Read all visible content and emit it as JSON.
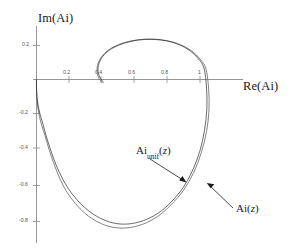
{
  "figure": {
    "background_color": "#ffffff",
    "axis_color": "#8a8a8a",
    "curve_ai_color": "#6d6d6d",
    "curve_unif_color": "#2b2b2b"
  },
  "axes": {
    "x_title": "Re(Ai)",
    "y_title": "Im(Ai)",
    "x_ticks": [
      "0.2",
      "0.4",
      "0.6",
      "0.8",
      "1"
    ],
    "y_ticks": [
      "0.2",
      "-0.2",
      "-0.4",
      "-0.6",
      "-0.8"
    ]
  },
  "annotations": {
    "unif": {
      "base": "Ai",
      "sub": "unif",
      "arg": "(",
      "var": "z",
      "close": ")"
    },
    "exact": {
      "base": "Ai",
      "arg": "(",
      "var": "z",
      "close": ")"
    }
  },
  "chart_data": {
    "type": "line",
    "title": "",
    "xlabel": "Re(Ai)",
    "ylabel": "Im(Ai)",
    "xlim": [
      -0.05,
      1.12
    ],
    "ylim": [
      -0.92,
      0.28
    ],
    "grid": false,
    "legend": "annotated-arrows",
    "xticks": [
      0.2,
      0.4,
      0.6,
      0.8,
      1.0
    ],
    "yticks": [
      0.2,
      -0.2,
      -0.4,
      -0.6,
      -0.8
    ],
    "series": [
      {
        "name": "Ai(z)",
        "color": "#6d6d6d",
        "points": [
          [
            0.0,
            0.0
          ],
          [
            0.0,
            -0.055
          ],
          [
            0.002,
            -0.11
          ],
          [
            0.008,
            -0.165
          ],
          [
            0.018,
            -0.218
          ],
          [
            0.032,
            -0.27
          ],
          [
            0.052,
            -0.33
          ],
          [
            0.07,
            -0.39
          ],
          [
            0.09,
            -0.45
          ],
          [
            0.116,
            -0.52
          ],
          [
            0.146,
            -0.59
          ],
          [
            0.186,
            -0.662
          ],
          [
            0.238,
            -0.73
          ],
          [
            0.3,
            -0.79
          ],
          [
            0.375,
            -0.838
          ],
          [
            0.46,
            -0.868
          ],
          [
            0.552,
            -0.873
          ],
          [
            0.648,
            -0.852
          ],
          [
            0.74,
            -0.806
          ],
          [
            0.822,
            -0.738
          ],
          [
            0.9,
            -0.65
          ],
          [
            0.962,
            -0.546
          ],
          [
            1.008,
            -0.43
          ],
          [
            1.04,
            -0.306
          ],
          [
            1.055,
            -0.18
          ],
          [
            1.053,
            -0.056
          ],
          [
            1.036,
            0.064
          ],
          [
            1.002,
            0.118
          ],
          [
            0.95,
            0.168
          ],
          [
            0.88,
            0.205
          ],
          [
            0.8,
            0.228
          ],
          [
            0.712,
            0.238
          ],
          [
            0.624,
            0.234
          ],
          [
            0.54,
            0.218
          ],
          [
            0.468,
            0.19
          ],
          [
            0.414,
            0.152
          ],
          [
            0.382,
            0.108
          ],
          [
            0.37,
            0.06
          ],
          [
            0.378,
            0.016
          ],
          [
            0.402,
            -0.02
          ]
        ]
      },
      {
        "name": "Ai_unif(z)",
        "color": "#2b2b2b",
        "points": [
          [
            0.0,
            0.0
          ],
          [
            0.0,
            -0.05
          ],
          [
            0.003,
            -0.1
          ],
          [
            0.01,
            -0.152
          ],
          [
            0.022,
            -0.205
          ],
          [
            0.038,
            -0.258
          ],
          [
            0.054,
            -0.315
          ],
          [
            0.072,
            -0.372
          ],
          [
            0.092,
            -0.43
          ],
          [
            0.118,
            -0.498
          ],
          [
            0.15,
            -0.566
          ],
          [
            0.192,
            -0.638
          ],
          [
            0.246,
            -0.706
          ],
          [
            0.31,
            -0.766
          ],
          [
            0.386,
            -0.814
          ],
          [
            0.47,
            -0.844
          ],
          [
            0.56,
            -0.85
          ],
          [
            0.654,
            -0.83
          ],
          [
            0.744,
            -0.786
          ],
          [
            0.824,
            -0.72
          ],
          [
            0.898,
            -0.634
          ],
          [
            0.956,
            -0.532
          ],
          [
            1.0,
            -0.418
          ],
          [
            1.028,
            -0.296
          ],
          [
            1.042,
            -0.172
          ],
          [
            1.04,
            -0.05
          ],
          [
            1.024,
            0.068
          ],
          [
            0.99,
            0.122
          ],
          [
            0.938,
            0.17
          ],
          [
            0.87,
            0.206
          ],
          [
            0.792,
            0.228
          ],
          [
            0.706,
            0.236
          ],
          [
            0.62,
            0.232
          ],
          [
            0.538,
            0.214
          ],
          [
            0.468,
            0.186
          ],
          [
            0.416,
            0.148
          ],
          [
            0.386,
            0.104
          ],
          [
            0.376,
            0.058
          ],
          [
            0.386,
            0.016
          ],
          [
            0.41,
            -0.018
          ]
        ]
      }
    ]
  }
}
